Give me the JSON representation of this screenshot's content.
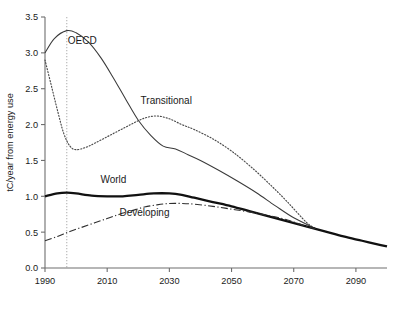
{
  "chart_data": {
    "type": "line",
    "title": "",
    "xlabel": "",
    "ylabel": "tC/year from energy use",
    "xlim": [
      1990,
      2100
    ],
    "ylim": [
      0.0,
      3.5
    ],
    "grid": false,
    "legend": "inline-labels",
    "xticks": [
      "1990",
      "2010",
      "2030",
      "2050",
      "2070",
      "2090"
    ],
    "xtick_values": [
      1990,
      2010,
      2030,
      2050,
      2070,
      2090
    ],
    "yticks": [
      "0.0",
      "0.5",
      "1.0",
      "1.5",
      "2.0",
      "2.5",
      "3.0",
      "3.5"
    ],
    "ytick_values": [
      0.0,
      0.5,
      1.0,
      1.5,
      2.0,
      2.5,
      3.0,
      3.5
    ],
    "annotations": [
      {
        "name": "vertical-marker",
        "x": 1997,
        "style": "dotted-vertical"
      }
    ],
    "series": [
      {
        "name": "OECD",
        "style": "solid-thin",
        "label_x": 2002,
        "label_y": 3.12,
        "x": [
          1990,
          1993,
          1997,
          2000,
          2004,
          2008,
          2012,
          2016,
          2020,
          2024,
          2028,
          2032,
          2036,
          2040,
          2046,
          2052,
          2058,
          2064,
          2070,
          2077
        ],
        "y": [
          3.0,
          3.2,
          3.31,
          3.28,
          3.15,
          2.93,
          2.65,
          2.35,
          2.06,
          1.85,
          1.7,
          1.66,
          1.58,
          1.5,
          1.36,
          1.21,
          1.05,
          0.87,
          0.7,
          0.55
        ]
      },
      {
        "name": "Transitional",
        "style": "dotted",
        "label_x": 2029,
        "label_y": 2.28,
        "x": [
          1990,
          1992,
          1994,
          1996,
          1998,
          2000,
          2003,
          2006,
          2010,
          2014,
          2018,
          2022,
          2026,
          2030,
          2034,
          2038,
          2044,
          2050,
          2056,
          2062,
          2068,
          2074,
          2077
        ],
        "y": [
          2.9,
          2.55,
          2.2,
          1.88,
          1.7,
          1.65,
          1.68,
          1.74,
          1.83,
          1.92,
          2.01,
          2.09,
          2.12,
          2.08,
          2.0,
          1.93,
          1.8,
          1.63,
          1.42,
          1.18,
          0.92,
          0.64,
          0.55
        ]
      },
      {
        "name": "World",
        "style": "solid-thick",
        "label_x": 2012,
        "label_y": 1.18,
        "x": [
          1990,
          1994,
          1997,
          2000,
          2005,
          2010,
          2015,
          2020,
          2025,
          2030,
          2034,
          2038,
          2044,
          2050,
          2056,
          2062,
          2068,
          2074,
          2080,
          2086,
          2092,
          2098,
          2100
        ],
        "y": [
          1.0,
          1.04,
          1.05,
          1.04,
          1.01,
          1.0,
          1.0,
          1.02,
          1.04,
          1.04,
          1.02,
          0.98,
          0.92,
          0.86,
          0.79,
          0.72,
          0.65,
          0.58,
          0.51,
          0.44,
          0.38,
          0.32,
          0.3
        ]
      },
      {
        "name": "Developing",
        "style": "dash-dot",
        "label_x": 2022,
        "label_y": 0.72,
        "x": [
          1990,
          1994,
          1998,
          2002,
          2006,
          2010,
          2014,
          2018,
          2022,
          2026,
          2030,
          2034,
          2038,
          2044,
          2050,
          2056,
          2062,
          2068,
          2074,
          2077
        ],
        "y": [
          0.38,
          0.44,
          0.51,
          0.57,
          0.63,
          0.69,
          0.75,
          0.8,
          0.85,
          0.88,
          0.9,
          0.9,
          0.89,
          0.86,
          0.82,
          0.78,
          0.73,
          0.67,
          0.58,
          0.55
        ]
      }
    ]
  }
}
